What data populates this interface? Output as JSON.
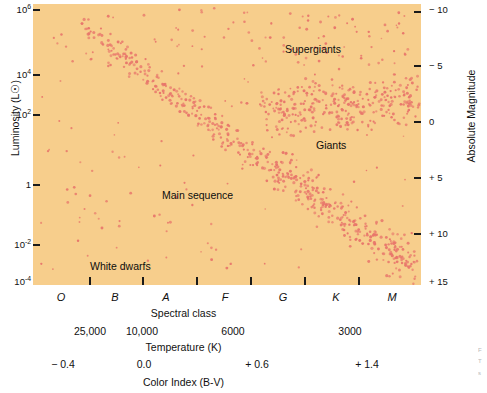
{
  "figure": {
    "background_color": "#ffffff",
    "plot_background_color": "#F7CE8C",
    "point_color": "#E8766B",
    "axis_color": "#1a1a1a"
  },
  "chart_data": {
    "type": "scatter",
    "title": "",
    "subtitle": "",
    "grid": false,
    "legend_position": "none",
    "ylabel": "Luminosity (L☉)",
    "ylabel_right": "Absolute Magnitude",
    "y_ticks": [
      "10⁶",
      "10⁴",
      "10²",
      "1",
      "10⁻²",
      "10⁻⁴"
    ],
    "y_tick_mantissas": [
      "10",
      "10",
      "10",
      "1",
      "10",
      "10"
    ],
    "y_tick_exponents": [
      "6",
      "4",
      "2",
      "",
      "-2",
      "-4"
    ],
    "y_tick_values": [
      1000000,
      10000,
      100,
      1,
      0.01,
      0.0001
    ],
    "ylim": [
      0.0001,
      1000000
    ],
    "y_right_ticks": [
      "− 10",
      "− 5",
      "0",
      "+ 5",
      "+ 10",
      "+ 15"
    ],
    "y_right_values": [
      -10,
      -5,
      0,
      5,
      10,
      15
    ],
    "y_right_lim": [
      -10,
      15
    ],
    "x_axes": [
      {
        "name": "spectral-class",
        "title": "Spectral class",
        "italic": true,
        "ticks": [
          "O",
          "B",
          "A",
          "F",
          "G",
          "K",
          "M"
        ],
        "tick_px": [
          61,
          115,
          166,
          225,
          283,
          336,
          392
        ]
      },
      {
        "name": "temperature",
        "title": "Temperature (K)",
        "italic": false,
        "ticks": [
          "25,000",
          "10,000",
          "6000",
          "3000"
        ],
        "tick_px": [
          90,
          142,
          233,
          350
        ]
      },
      {
        "name": "color-index",
        "title": "Color Index (B-V)",
        "italic": false,
        "ticks": [
          "− 0.4",
          "0.0",
          "+ 0.6",
          "+ 1.4"
        ],
        "tick_px": [
          63,
          144,
          257,
          367
        ]
      }
    ],
    "annotations": [
      {
        "name": "supergiants",
        "label": "Supergiants",
        "x_px": 285,
        "y_px": 44
      },
      {
        "name": "giants",
        "label": "Giants",
        "x_px": 316,
        "y_px": 140
      },
      {
        "name": "main-sequence",
        "label": "Main sequence",
        "x_px": 162,
        "y_px": 190
      },
      {
        "name": "white-dwarfs",
        "label": "White dwarfs",
        "x_px": 90,
        "y_px": 261
      }
    ],
    "populations": [
      {
        "name": "main-sequence",
        "count": 520,
        "description": "diagonal band from hot/luminous upper-left to cool/faint lower-right"
      },
      {
        "name": "giants",
        "count": 230,
        "description": "horizontal clump near luminosity 10^2, spectral classes G-K"
      },
      {
        "name": "supergiants",
        "count": 55,
        "description": "sparse scatter across top of diagram above luminosity 10^4"
      },
      {
        "name": "white-dwarfs",
        "count": 28,
        "description": "sparse group at low luminosity, lower-left to lower-middle"
      }
    ]
  },
  "edge_caption": {
    "lines": [
      "F",
      "T",
      "s"
    ]
  }
}
